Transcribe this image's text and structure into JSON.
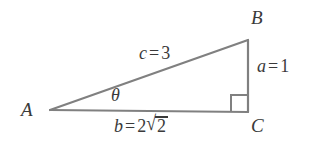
{
  "figure": {
    "type": "right-triangle-diagram",
    "background_color": "#ffffff",
    "stroke_color": "#808080",
    "text_color": "#3a3a3a",
    "vertices": {
      "A": {
        "label": "A",
        "x": 50,
        "y": 110
      },
      "B": {
        "label": "B",
        "x": 248,
        "y": 40
      },
      "C": {
        "label": "C",
        "x": 248,
        "y": 112
      }
    },
    "angle_marks": {
      "theta": {
        "label": "θ",
        "at_vertex": "A"
      },
      "right_angle": {
        "at_vertex": "C",
        "size": 17
      }
    },
    "sides": {
      "hypotenuse": {
        "name": "c",
        "equals": "=",
        "value": "3",
        "between": "A-B"
      },
      "opposite": {
        "name": "a",
        "equals": "=",
        "value": "1",
        "between": "B-C"
      },
      "adjacent": {
        "name": "b",
        "equals": "=",
        "coefficient": "2",
        "radical_sign": "√",
        "radicand": "2",
        "between": "A-C"
      }
    }
  }
}
